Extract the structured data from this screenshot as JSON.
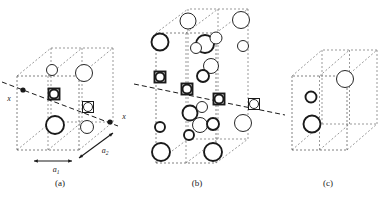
{
  "figure": {
    "title": "",
    "background_color": "#ffffff",
    "ink_color": "#1a1a1a",
    "cell_edge_color": "#555555",
    "panels": [
      {
        "id": "a",
        "caption": "(a)",
        "axis_label_left": "x",
        "axis_label_right": "x",
        "vector_labels": [
          "a",
          "a"
        ],
        "vector_subscripts": [
          "1",
          "2"
        ],
        "atom_counts": {
          "bold_circles": 2,
          "thin_circles": 2,
          "square_sites": 2,
          "axis_nodes": 2
        }
      },
      {
        "id": "b",
        "caption": "(b)",
        "atom_counts": {
          "bold_circles": 9,
          "thin_circles": 8,
          "square_sites": 4
        }
      },
      {
        "id": "c",
        "caption": "(c)",
        "atom_counts": {
          "bold_circles": 2,
          "thin_circles": 1
        }
      }
    ],
    "legend": {
      "bold_circle": "front-layer atom",
      "thin_circle": "back-layer atom",
      "square_site": "symmetry-axis site",
      "filled_dot": "axis intersection node"
    }
  },
  "chart_data": {
    "type": "diagram",
    "title": "",
    "subtitle": "",
    "xlabel": "",
    "ylabel": "",
    "grid": false,
    "legend_position": "none",
    "panels": [
      {
        "name": "(a)",
        "cell": {
          "ox": 17,
          "oy": 150,
          "w": 62,
          "h": -74,
          "dx": 34,
          "dy": -28
        },
        "axis_line": {
          "x1": 2,
          "y1": 82,
          "x2": 118,
          "y2": 126,
          "style": "dashed"
        },
        "axis_nodes": [
          {
            "x": 23,
            "y": 90
          },
          {
            "x": 110,
            "y": 122
          }
        ],
        "atoms": [
          {
            "x": 52,
            "y": 70,
            "r": 5.5,
            "weight": "thin",
            "layer": "back"
          },
          {
            "x": 84,
            "y": 73,
            "r": 8.5,
            "weight": "thin",
            "layer": "back"
          },
          {
            "x": 54,
            "y": 94,
            "r": 4.5,
            "weight": "bold",
            "layer": "front",
            "square": true,
            "sq": 11
          },
          {
            "x": 88,
            "y": 107,
            "r": 4.5,
            "weight": "thin",
            "layer": "back",
            "square": true,
            "sq": 11
          },
          {
            "x": 55,
            "y": 125,
            "r": 9.0,
            "weight": "bold",
            "layer": "front"
          },
          {
            "x": 87,
            "y": 127,
            "r": 6.5,
            "weight": "thin",
            "layer": "back"
          }
        ],
        "vectors": [
          {
            "label": "a",
            "sub": "1",
            "x1": 34,
            "y1": 161,
            "x2": 72,
            "y2": 161,
            "tx": 56,
            "ty": 172,
            "dir": "left"
          },
          {
            "label": "a",
            "sub": "2",
            "x1": 79,
            "y1": 158,
            "x2": 113,
            "y2": 133,
            "tx": 105,
            "ty": 153,
            "dir": "up-right"
          }
        ],
        "caption_pos": {
          "x": 60,
          "y": 186
        }
      },
      {
        "name": "(b)",
        "cell": {
          "ox": 156,
          "oy": 163,
          "w": 60,
          "h": -130,
          "dx": 32,
          "dy": -24
        },
        "axis_line": {
          "x1": 134,
          "y1": 84,
          "x2": 285,
          "y2": 115,
          "style": "dashed"
        },
        "atoms": [
          {
            "x": 188,
            "y": 21,
            "r": 8.0,
            "weight": "thin",
            "layer": "back"
          },
          {
            "x": 241,
            "y": 20,
            "r": 8.5,
            "weight": "thin",
            "layer": "back"
          },
          {
            "x": 160,
            "y": 42,
            "r": 8.5,
            "weight": "bold",
            "layer": "front"
          },
          {
            "x": 205,
            "y": 44,
            "r": 9.0,
            "weight": "bold",
            "layer": "front"
          },
          {
            "x": 216,
            "y": 38,
            "r": 6.0,
            "weight": "thin",
            "layer": "back"
          },
          {
            "x": 196,
            "y": 48,
            "r": 5.5,
            "weight": "thin",
            "layer": "back"
          },
          {
            "x": 243,
            "y": 46,
            "r": 5.5,
            "weight": "thin",
            "layer": "back"
          },
          {
            "x": 211,
            "y": 66,
            "r": 7.5,
            "weight": "thin",
            "layer": "back"
          },
          {
            "x": 203,
            "y": 76,
            "r": 6.0,
            "weight": "bold",
            "layer": "front"
          },
          {
            "x": 160,
            "y": 77,
            "r": 4.5,
            "weight": "bold",
            "layer": "front",
            "square": true,
            "sq": 11
          },
          {
            "x": 187,
            "y": 89,
            "r": 4.5,
            "weight": "bold",
            "layer": "front",
            "square": true,
            "sq": 11
          },
          {
            "x": 219,
            "y": 99,
            "r": 4.5,
            "weight": "bold",
            "layer": "front",
            "square": true,
            "sq": 11
          },
          {
            "x": 254,
            "y": 104,
            "r": 4.5,
            "weight": "thin",
            "layer": "back",
            "square": true,
            "sq": 11
          },
          {
            "x": 190,
            "y": 113,
            "r": 7.5,
            "weight": "bold",
            "layer": "front"
          },
          {
            "x": 202,
            "y": 107,
            "r": 5.5,
            "weight": "thin",
            "layer": "back"
          },
          {
            "x": 160,
            "y": 127,
            "r": 5.0,
            "weight": "bold",
            "layer": "front"
          },
          {
            "x": 200,
            "y": 125,
            "r": 7.5,
            "weight": "thin",
            "layer": "back"
          },
          {
            "x": 213,
            "y": 124,
            "r": 6.0,
            "weight": "bold",
            "layer": "front"
          },
          {
            "x": 189,
            "y": 135,
            "r": 5.0,
            "weight": "bold",
            "layer": "front"
          },
          {
            "x": 243,
            "y": 123,
            "r": 8.5,
            "weight": "thin",
            "layer": "back"
          },
          {
            "x": 161,
            "y": 152,
            "r": 9.0,
            "weight": "bold",
            "layer": "front"
          },
          {
            "x": 213,
            "y": 152,
            "r": 9.0,
            "weight": "bold",
            "layer": "front"
          }
        ],
        "caption_pos": {
          "x": 197,
          "y": 186
        }
      },
      {
        "name": "(c)",
        "cell": {
          "ox": 292,
          "oy": 150,
          "w": 55,
          "h": -74,
          "dx": 30,
          "dy": -26
        },
        "atoms": [
          {
            "x": 345,
            "y": 79,
            "r": 8.5,
            "weight": "thin",
            "layer": "back"
          },
          {
            "x": 311,
            "y": 97,
            "r": 5.5,
            "weight": "bold",
            "layer": "front"
          },
          {
            "x": 312,
            "y": 124,
            "r": 8.5,
            "weight": "bold",
            "layer": "front"
          }
        ],
        "caption_pos": {
          "x": 328,
          "y": 186
        }
      }
    ]
  }
}
